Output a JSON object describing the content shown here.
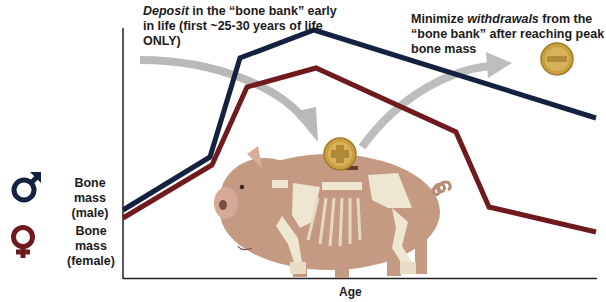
{
  "annotations": {
    "deposit": {
      "emphasis": "Deposit",
      "rest": " in the “bone bank” early in life (first ~25-30 years of life ONLY)"
    },
    "withdraw": {
      "prefix": "Minimize ",
      "emphasis": "withdrawals",
      "rest": " from the “bone bank” after reaching peak bone mass"
    }
  },
  "legend": [
    {
      "icon": "male-symbol-icon",
      "label": "Bone mass (male)",
      "color": "#14213f"
    },
    {
      "icon": "female-symbol-icon",
      "label": "Bone mass (female)",
      "color": "#6e1a1e"
    }
  ],
  "coins": {
    "deposit": "plus-coin",
    "withdraw": "minus-coin"
  },
  "colors": {
    "male": "#14213f",
    "female": "#6e1a1e",
    "arrow": "#b9b9b9",
    "pig": "#c49a82",
    "bone": "#efe6d2",
    "coin": "#c9a040"
  },
  "chart_data": {
    "type": "line",
    "title": "",
    "xlabel": "Age",
    "ylabel": "",
    "x": [
      0,
      1,
      2,
      3,
      4,
      5,
      6
    ],
    "series": [
      {
        "name": "Bone mass (male)",
        "color": "#14213f",
        "points_px": [
          [
            123,
            210
          ],
          [
            210,
            157
          ],
          [
            240,
            58
          ],
          [
            314,
            30
          ],
          [
            596,
            118
          ]
        ]
      },
      {
        "name": "Bone mass (female)",
        "color": "#6e1a1e",
        "points_px": [
          [
            123,
            218
          ],
          [
            212,
            165
          ],
          [
            247,
            87
          ],
          [
            316,
            68
          ],
          [
            456,
            132
          ],
          [
            489,
            207
          ],
          [
            596,
            232
          ]
        ]
      }
    ],
    "grid": false,
    "legend_position": "left"
  }
}
